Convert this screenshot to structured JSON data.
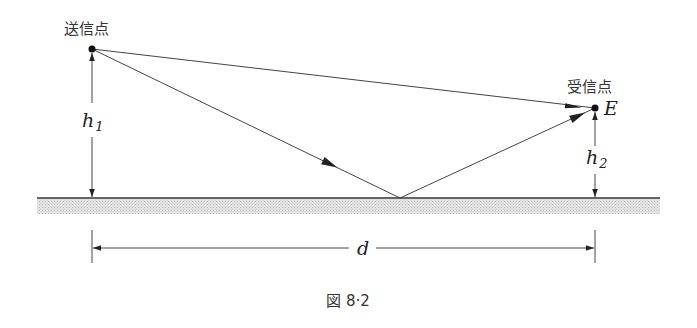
{
  "figure": {
    "caption": "図 8·2",
    "labels": {
      "transmitter": "送信点",
      "receiver": "受信点",
      "field_strength": "E",
      "h1_main": "h",
      "h1_sub": "1",
      "h2_main": "h",
      "h2_sub": "2",
      "distance": "d"
    },
    "colors": {
      "line": "#3a3a3a",
      "ground_line": "#333333",
      "ground_fill": "#d9d9d9",
      "background": "#ffffff"
    },
    "geometry": {
      "transmitter_point": [
        92,
        49
      ],
      "receiver_point": [
        595,
        108
      ],
      "reflection_point": [
        400,
        198
      ],
      "ground_y": 198
    }
  }
}
